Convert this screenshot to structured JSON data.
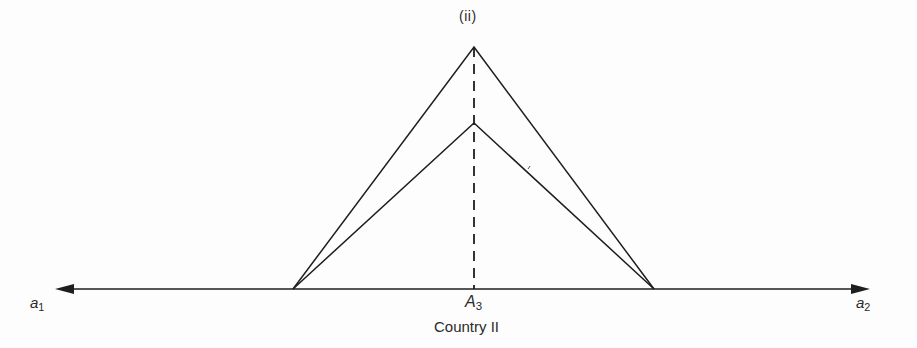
{
  "diagram": {
    "peak_label": "(ii)",
    "axis": {
      "left_label": {
        "base": "a",
        "sub": "1"
      },
      "right_label": {
        "base": "a",
        "sub": "2"
      },
      "center_label": {
        "base": "A",
        "sub": "3"
      }
    },
    "caption": "Country II",
    "colors": {
      "line": "#1e1e1e",
      "background": "#fdfdfd"
    },
    "geometry": {
      "axis_y": 289,
      "axis_x_start": 55,
      "axis_x_end": 870,
      "outer_peak": [
        474,
        47
      ],
      "inner_peak": [
        474,
        123
      ],
      "left_base": [
        293,
        289
      ],
      "right_base": [
        654,
        289
      ]
    }
  }
}
